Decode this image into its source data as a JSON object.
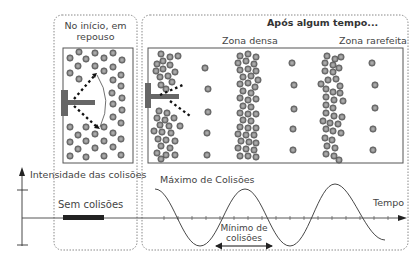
{
  "panels": {
    "left": {
      "title_line1": "No início, em",
      "title_line2": "repouso"
    },
    "right": {
      "title": "Após algum tempo...",
      "zone_dense": "Zona densa",
      "zone_sparse": "Zona rarefeita"
    }
  },
  "graph": {
    "y_axis_label": "Intensidade das colisões",
    "x_axis_label": "Tempo",
    "no_collisions_label": "Sem colisões",
    "max_label": "Máximo de Colisões",
    "min_label_line1": "Mínimo de",
    "min_label_line2": "colisões"
  },
  "colors": {
    "particle_fill": "#8a8a8a",
    "particle_stroke": "#555555",
    "piston": "#666666",
    "border": "#555555",
    "dotted_border": "#888888"
  }
}
